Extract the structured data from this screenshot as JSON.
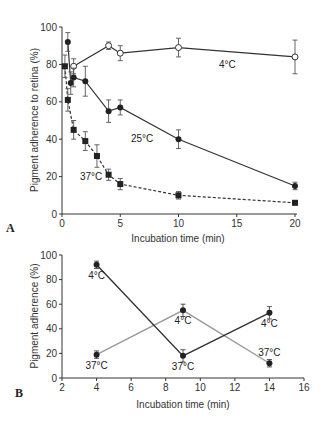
{
  "chart_data": [
    {
      "panel": "A",
      "type": "line",
      "title": "",
      "xlabel": "Incubation time (min)",
      "ylabel": "Pigment adherence to retina (%)",
      "xlim": [
        0,
        20
      ],
      "ylim": [
        0,
        100
      ],
      "xticks": [
        0,
        5,
        10,
        15,
        20
      ],
      "yticks": [
        0,
        20,
        40,
        60,
        80,
        100
      ],
      "grid": false,
      "legend": "inline annotations",
      "series": [
        {
          "name": "4°C",
          "marker": "open-circle",
          "line": "solid",
          "x": [
            1,
            4,
            5,
            10,
            20
          ],
          "y": [
            79,
            90,
            86,
            89,
            84
          ],
          "err": [
            4,
            2,
            4,
            5,
            9
          ]
        },
        {
          "name": "25°C",
          "marker": "filled-circle",
          "line": "solid",
          "x": [
            0.5,
            0.75,
            1,
            2,
            4,
            5,
            10,
            20
          ],
          "y": [
            92,
            70,
            73,
            71,
            55,
            57,
            40,
            15
          ],
          "err": [
            5,
            6,
            5,
            8,
            6,
            4,
            5,
            2
          ]
        },
        {
          "name": "37°C",
          "marker": "filled-square",
          "line": "dashed",
          "x": [
            0.25,
            0.5,
            1,
            2,
            3,
            4,
            5,
            10,
            20
          ],
          "y": [
            79,
            61,
            45,
            39,
            31,
            21,
            16,
            10,
            6
          ],
          "err": [
            6,
            6,
            5,
            5,
            6,
            3,
            3,
            2,
            1
          ]
        }
      ]
    },
    {
      "panel": "B",
      "type": "line",
      "title": "",
      "xlabel": "Incubation time (min)",
      "ylabel": "Pigment adherence (%)",
      "xlim": [
        2,
        16
      ],
      "ylim": [
        0,
        100
      ],
      "xticks": [
        2,
        4,
        6,
        8,
        10,
        12,
        14,
        16
      ],
      "yticks": [
        0,
        20,
        40,
        60,
        80,
        100
      ],
      "grid": false,
      "legend": "inline annotations",
      "series": [
        {
          "name": "dark series (4°C → 37°C → 4°C)",
          "color": "#333333",
          "x": [
            4,
            9,
            14
          ],
          "y": [
            92,
            18,
            53
          ],
          "err": [
            3,
            5,
            5
          ],
          "labels": [
            "4°C",
            "37°C",
            "4°C"
          ]
        },
        {
          "name": "light series (37°C → 4°C → 37°C)",
          "color": "#999999",
          "x": [
            4,
            9,
            14
          ],
          "y": [
            19,
            55,
            12
          ],
          "err": [
            3,
            5,
            3
          ],
          "labels": [
            "37°C",
            "4°C",
            "37°C"
          ]
        }
      ]
    }
  ],
  "labels": {
    "panelA": "A",
    "panelB": "B",
    "a_xlabel": "Incubation time (min)",
    "a_ylabel": "Pigment adherence to retina (%)",
    "b_xlabel": "Incubation time (min)",
    "b_ylabel": "Pigment adherence (%)",
    "a_ann_4": "4°C",
    "a_ann_25": "25°C",
    "a_ann_37": "37°C"
  }
}
